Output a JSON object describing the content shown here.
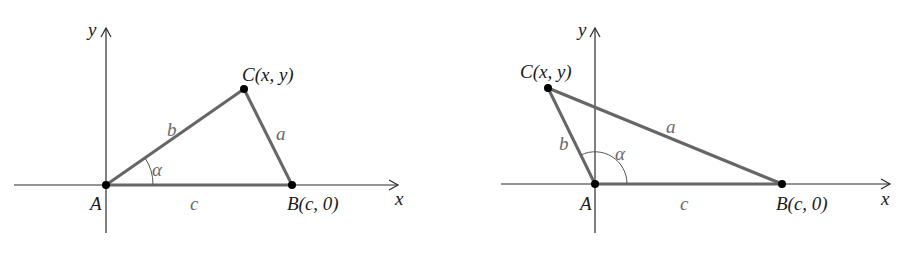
{
  "figure": {
    "panels": [
      {
        "id": "acute",
        "axis_labels": {
          "x": "x",
          "y": "y"
        },
        "points": {
          "A": {
            "label": "A"
          },
          "B": {
            "label": "B(c, 0)"
          },
          "C": {
            "label": "C(x, y)"
          }
        },
        "sides": {
          "a": "a",
          "b": "b",
          "c": "c"
        },
        "angle": "α"
      },
      {
        "id": "obtuse",
        "axis_labels": {
          "x": "x",
          "y": "y"
        },
        "points": {
          "A": {
            "label": "A"
          },
          "B": {
            "label": "B(c, 0)"
          },
          "C": {
            "label": "C(x, y)"
          }
        },
        "sides": {
          "a": "a",
          "b": "b",
          "c": "c"
        },
        "angle": "α"
      }
    ],
    "colors": {
      "axis": "#2a2a2a",
      "side": "#666666",
      "point": "#000000",
      "side_label": "#6a6a6a"
    }
  }
}
